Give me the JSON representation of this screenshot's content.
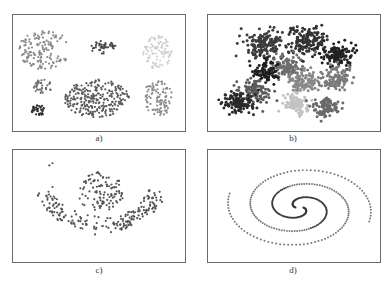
{
  "figure": {
    "panels": [
      {
        "id": "a",
        "caption": "a)"
      },
      {
        "id": "b",
        "caption": "b)"
      },
      {
        "id": "c",
        "caption": "c)"
      },
      {
        "id": "d",
        "caption": "d)"
      }
    ]
  },
  "chart_data": [
    {
      "type": "scatter",
      "title": "a)",
      "description": "Seven blob-shaped clusters of varying density and gray shade",
      "xlim": [
        0,
        173
      ],
      "ylim": [
        0,
        117
      ],
      "clusters": [
        {
          "cx": 32,
          "cy": 35,
          "rx": 27,
          "ry": 20,
          "n": 150,
          "color": "#8a8a8a",
          "shape": "crescent"
        },
        {
          "cx": 91,
          "cy": 33,
          "rx": 14,
          "ry": 7,
          "n": 45,
          "color": "#4a4a4a"
        },
        {
          "cx": 146,
          "cy": 38,
          "rx": 15,
          "ry": 17,
          "n": 90,
          "color": "#cfcfcf"
        },
        {
          "cx": 30,
          "cy": 72,
          "rx": 10,
          "ry": 7,
          "n": 35,
          "color": "#6e6e6e"
        },
        {
          "cx": 84,
          "cy": 84,
          "rx": 33,
          "ry": 19,
          "n": 260,
          "color": "#5a5a5a"
        },
        {
          "cx": 146,
          "cy": 84,
          "rx": 15,
          "ry": 18,
          "n": 100,
          "color": "#8c8c8c"
        },
        {
          "cx": 26,
          "cy": 96,
          "rx": 8,
          "ry": 5,
          "n": 35,
          "color": "#2e2e2e"
        }
      ]
    },
    {
      "type": "scatter",
      "title": "b)",
      "description": "Many overlapping dense Gaussian clusters in multiple shades",
      "xlim": [
        0,
        173
      ],
      "ylim": [
        0,
        117
      ],
      "clusters": [
        {
          "cx": 55,
          "cy": 30,
          "rx": 17,
          "ry": 14,
          "n": 150,
          "color": "#3c3c3c"
        },
        {
          "cx": 100,
          "cy": 27,
          "rx": 18,
          "ry": 12,
          "n": 150,
          "color": "#333333"
        },
        {
          "cx": 130,
          "cy": 40,
          "rx": 15,
          "ry": 11,
          "n": 120,
          "color": "#222222"
        },
        {
          "cx": 80,
          "cy": 52,
          "rx": 15,
          "ry": 11,
          "n": 110,
          "color": "#6e6e6e"
        },
        {
          "cx": 58,
          "cy": 58,
          "rx": 13,
          "ry": 10,
          "n": 90,
          "color": "#1e1e1e"
        },
        {
          "cx": 95,
          "cy": 68,
          "rx": 14,
          "ry": 11,
          "n": 110,
          "color": "#888888"
        },
        {
          "cx": 130,
          "cy": 65,
          "rx": 14,
          "ry": 12,
          "n": 110,
          "color": "#7a7a7a"
        },
        {
          "cx": 48,
          "cy": 78,
          "rx": 15,
          "ry": 11,
          "n": 110,
          "color": "#5c5c5c"
        },
        {
          "cx": 30,
          "cy": 88,
          "rx": 15,
          "ry": 10,
          "n": 120,
          "color": "#2a2a2a"
        },
        {
          "cx": 90,
          "cy": 90,
          "rx": 12,
          "ry": 9,
          "n": 90,
          "color": "#c2c2c2"
        },
        {
          "cx": 118,
          "cy": 93,
          "rx": 13,
          "ry": 9,
          "n": 100,
          "color": "#6a6a6a"
        }
      ]
    },
    {
      "type": "scatter",
      "title": "c)",
      "description": "Sparse smiley-like shape: round upper cluster plus U-shaped lower arc and two outliers",
      "xlim": [
        0,
        173
      ],
      "ylim": [
        0,
        113
      ],
      "clusters": [
        {
          "cx": 88,
          "cy": 42,
          "rx": 24,
          "ry": 20,
          "n": 110,
          "color": "#555555"
        },
        {
          "cx": 88,
          "cy": 45,
          "rx": 66,
          "ry": 50,
          "n": 200,
          "color": "#555555",
          "shape": "arc"
        },
        {
          "cx": 37,
          "cy": 13,
          "rx": 3,
          "ry": 4,
          "n": 2,
          "color": "#555555"
        }
      ]
    },
    {
      "type": "scatter",
      "title": "d)",
      "description": "Two-arm interleaved spiral, darker inner turns, lighter outer turns",
      "xlim": [
        0,
        173
      ],
      "ylim": [
        0,
        113
      ],
      "spiral": {
        "cx": 92,
        "cy": 58,
        "arms": 2,
        "turns": 1.55,
        "r0": 4,
        "r1": 74,
        "n_per_arm": 150,
        "aspect": 0.62,
        "colors": [
          "#3a3a3a",
          "#777777"
        ]
      }
    }
  ]
}
